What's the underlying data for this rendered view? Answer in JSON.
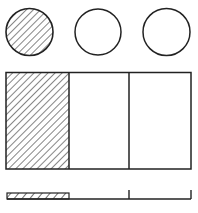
{
  "figure": {
    "fraction": {
      "numerator": 1,
      "denominator": 3
    },
    "colors": {
      "stroke": "#222222",
      "hatch": "#333333",
      "background": "#ffffff"
    },
    "set_model": {
      "circles": [
        {
          "cx": 29.5,
          "cy": 32,
          "r": 23.5,
          "shaded": true
        },
        {
          "cx": 98,
          "cy": 32,
          "r": 23,
          "shaded": false
        },
        {
          "cx": 166.5,
          "cy": 32,
          "r": 23.5,
          "shaded": false
        }
      ]
    },
    "area_model": {
      "x": 6,
      "y": 72.5,
      "width": 185,
      "height": 96.5,
      "dividers": [
        69,
        129
      ],
      "shaded_parts": 1,
      "total_parts": 3
    },
    "bar_model": {
      "baseline_y": 199,
      "x_start": 7,
      "x_end": 191,
      "shaded": {
        "x": 7,
        "y": 193,
        "width": 62,
        "height": 6
      },
      "ticks": [
        129,
        191
      ],
      "tick_top": 190
    }
  }
}
